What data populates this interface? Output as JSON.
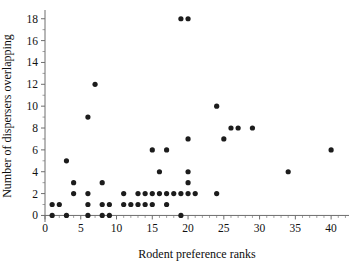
{
  "chart_data": {
    "type": "scatter",
    "title": "",
    "xlabel": "Rodent preference ranks",
    "ylabel": "Number of dispersers overlapping",
    "xlim": [
      0,
      42.5
    ],
    "ylim": [
      -0.6,
      18.8
    ],
    "xticks": [
      0,
      5,
      10,
      15,
      20,
      25,
      30,
      35,
      40
    ],
    "yticks": [
      0,
      2,
      4,
      6,
      8,
      10,
      12,
      14,
      16,
      18
    ],
    "xticklabels": [
      "0",
      "5",
      "10",
      "15",
      "20",
      "25",
      "30",
      "35",
      "40"
    ],
    "yticklabels": [
      "0",
      "2",
      "4",
      "6",
      "8",
      "10",
      "12",
      "14",
      "16",
      "18"
    ],
    "grid": false,
    "legend": null,
    "marker": "circle",
    "marker_color": "#1c1c1c",
    "marker_size": 2.6,
    "points": [
      [
        1,
        0
      ],
      [
        1,
        1
      ],
      [
        2,
        1
      ],
      [
        3,
        0
      ],
      [
        3,
        5
      ],
      [
        4,
        2
      ],
      [
        4,
        3
      ],
      [
        6,
        0
      ],
      [
        6,
        1
      ],
      [
        6,
        2
      ],
      [
        6,
        9
      ],
      [
        7,
        12
      ],
      [
        8,
        0
      ],
      [
        8,
        1
      ],
      [
        8,
        3
      ],
      [
        9,
        0
      ],
      [
        9,
        1
      ],
      [
        11,
        1
      ],
      [
        11,
        2
      ],
      [
        12,
        1
      ],
      [
        13,
        1
      ],
      [
        13,
        2
      ],
      [
        14,
        1
      ],
      [
        14,
        2
      ],
      [
        15,
        1
      ],
      [
        15,
        2
      ],
      [
        15,
        6
      ],
      [
        16,
        2
      ],
      [
        16,
        4
      ],
      [
        17,
        1
      ],
      [
        17,
        2
      ],
      [
        17,
        6
      ],
      [
        18,
        2
      ],
      [
        19,
        0
      ],
      [
        19,
        2
      ],
      [
        19,
        18
      ],
      [
        20,
        2
      ],
      [
        20,
        3
      ],
      [
        20,
        4
      ],
      [
        20,
        7
      ],
      [
        20,
        18
      ],
      [
        21,
        2
      ],
      [
        24,
        2
      ],
      [
        24,
        10
      ],
      [
        25,
        7
      ],
      [
        26,
        8
      ],
      [
        27,
        8
      ],
      [
        29,
        8
      ],
      [
        34,
        4
      ],
      [
        40,
        6
      ]
    ]
  },
  "axis_color": "#6e6e6e"
}
